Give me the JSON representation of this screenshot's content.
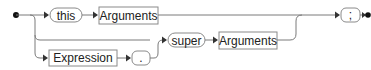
{
  "diagram": {
    "type": "railroad-syntax-diagram",
    "nodes": {
      "this_terminal": "this",
      "arguments_top": "Arguments",
      "semicolon_terminal": ";",
      "super_terminal": "super",
      "arguments_middle": "Arguments",
      "expression_nonterminal": "Expression",
      "dot_terminal": "."
    },
    "paths": [
      [
        "this",
        "Arguments",
        ";"
      ],
      [
        "super",
        "Arguments",
        ";"
      ],
      [
        "Expression",
        ".",
        "super",
        "Arguments",
        ";"
      ]
    ],
    "colors": {
      "line": "#7a7a7a",
      "border": "#8a8a8a",
      "text": "#222222",
      "marker": "#111111"
    }
  }
}
